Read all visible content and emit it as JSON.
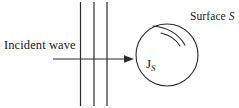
{
  "figure": {
    "type": "physics-scattering-diagram",
    "background_color": "#ffffff",
    "stroke_color": "#2b2b2b",
    "width": 239,
    "height": 108,
    "labels": {
      "incident_wave": "Incident wave",
      "surface_word": "Surface",
      "surface_symbol": "S",
      "current_symbol": "J",
      "current_subscript": "S"
    },
    "elements": {
      "wavefront_lines": {
        "name": "wavefront-lines",
        "count": 3,
        "x_positions": [
          80,
          94,
          107
        ],
        "y_top": 2,
        "y_bottom": 106
      },
      "propagation_arrow": {
        "name": "propagation-arrow",
        "x_start": 53,
        "x_end": 134,
        "y": 59
      },
      "scatterer_circle": {
        "name": "scatterer-surface-circle",
        "center_x": 167,
        "center_y": 55,
        "radius": 31
      },
      "curvature_arcs": {
        "name": "surface-current-arcs",
        "count": 2
      }
    }
  }
}
